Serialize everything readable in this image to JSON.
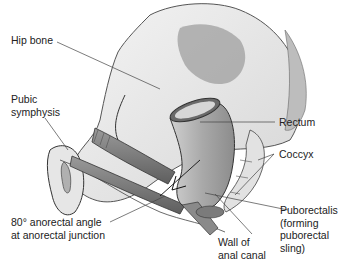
{
  "diagram": {
    "type": "anatomical-illustration",
    "colors": {
      "background": "#ffffff",
      "bone_fill": "#ececec",
      "bone_shadow": "#c9c9c9",
      "outline": "#333333",
      "muscle": "#7a7a7a",
      "rectum": "#b5b5b5",
      "leader": "#444444",
      "text": "#222222"
    },
    "labels": [
      {
        "id": "hip-bone",
        "text": "Hip bone"
      },
      {
        "id": "pubic-symphysis",
        "text": "Pubic\nsymphysis"
      },
      {
        "id": "rectum",
        "text": "Rectum"
      },
      {
        "id": "coccyx",
        "text": "Coccyx"
      },
      {
        "id": "anorectal-angle",
        "text": "80° anorectal angle\nat anorectal junction"
      },
      {
        "id": "wall-of-anal-canal",
        "text": "Wall of\nanal canal"
      },
      {
        "id": "puborectalis",
        "text": "Puborectalis\n(forming\npuborectal\nsling)"
      }
    ]
  }
}
